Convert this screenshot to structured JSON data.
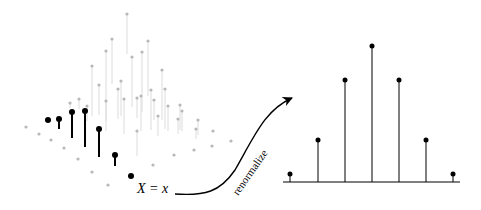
{
  "diagram": {
    "left_label": "X = x",
    "arrow_label": "renormalize",
    "colors": {
      "highlight": "#000000",
      "background_points": "#b8b8b8",
      "background_stems": "#dcdcdc"
    }
  },
  "left_joint": {
    "grey_points": [
      [
        127,
        14,
        40
      ],
      [
        112,
        39,
        45
      ],
      [
        148,
        41,
        55
      ],
      [
        106,
        51,
        70
      ],
      [
        142,
        52,
        60
      ],
      [
        92,
        66,
        50
      ],
      [
        132,
        57,
        50
      ],
      [
        162,
        70,
        50
      ],
      [
        99,
        85,
        30
      ],
      [
        121,
        81,
        35
      ],
      [
        118,
        89,
        30
      ],
      [
        151,
        90,
        40
      ],
      [
        165,
        89,
        40
      ],
      [
        79,
        99,
        10
      ],
      [
        106,
        101,
        30
      ],
      [
        124,
        99,
        35
      ],
      [
        137,
        98,
        20
      ],
      [
        141,
        96,
        35
      ],
      [
        154,
        100,
        20
      ],
      [
        87,
        106,
        15
      ],
      [
        168,
        106,
        25
      ],
      [
        180,
        105,
        25
      ],
      [
        158,
        116,
        20
      ],
      [
        182,
        111,
        20
      ],
      [
        178,
        119,
        15
      ],
      [
        198,
        120,
        15
      ],
      [
        137,
        131,
        25
      ],
      [
        196,
        129,
        10
      ],
      [
        213,
        131,
        0
      ],
      [
        231,
        141,
        0
      ],
      [
        26,
        127,
        0
      ],
      [
        39,
        134,
        0
      ],
      [
        51,
        140,
        0
      ],
      [
        64,
        148,
        0
      ],
      [
        78,
        159,
        0
      ],
      [
        92,
        172,
        0
      ],
      [
        108,
        185,
        0
      ],
      [
        153,
        165,
        0
      ],
      [
        174,
        155,
        0
      ],
      [
        194,
        150,
        0
      ],
      [
        212,
        146,
        0
      ],
      [
        70,
        103,
        5
      ]
    ],
    "slice_points": [
      [
        48,
        120,
        0
      ],
      [
        59,
        119,
        10
      ],
      [
        72,
        112,
        26
      ],
      [
        85,
        111,
        36
      ],
      [
        99,
        129,
        28
      ],
      [
        115,
        155,
        11
      ],
      [
        131,
        176,
        0
      ]
    ]
  },
  "right_stem_plot": {
    "baseline": {
      "x1": 283,
      "x2": 460,
      "y": 182
    },
    "stems": [
      {
        "x": 290,
        "top": 174
      },
      {
        "x": 318,
        "top": 140
      },
      {
        "x": 345,
        "top": 80
      },
      {
        "x": 372,
        "top": 46
      },
      {
        "x": 399,
        "top": 80
      },
      {
        "x": 426,
        "top": 140
      },
      {
        "x": 453,
        "top": 174
      }
    ]
  }
}
